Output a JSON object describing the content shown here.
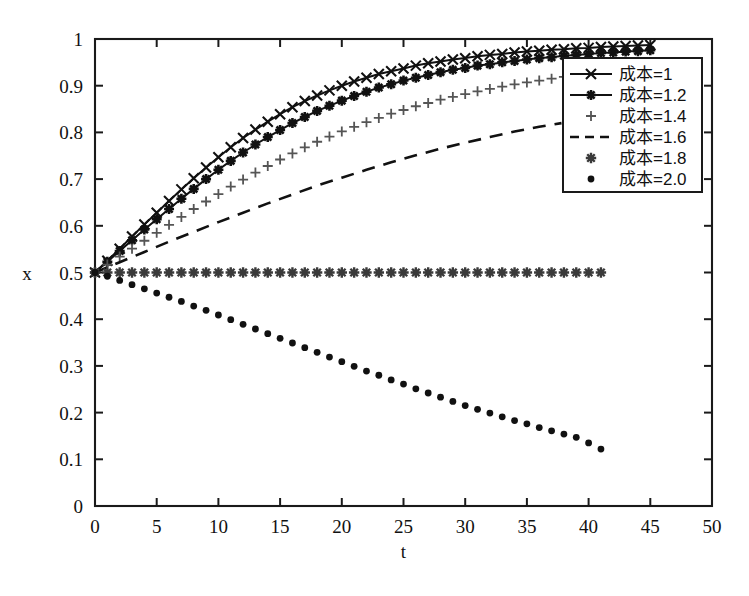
{
  "chart_data": {
    "type": "line",
    "title": "",
    "xlabel": "t",
    "ylabel": "x",
    "xlim": [
      0,
      50
    ],
    "ylim": [
      0,
      1
    ],
    "xticks": [
      0,
      5,
      10,
      15,
      20,
      25,
      30,
      35,
      40,
      45,
      50
    ],
    "xtick_labels": [
      "0",
      "5",
      "10",
      "15",
      "20",
      "25",
      "30",
      "35",
      "40",
      "45",
      "50"
    ],
    "yticks": [
      0,
      0.1,
      0.2,
      0.3,
      0.4,
      0.5,
      0.6,
      0.7,
      0.8,
      0.9,
      1
    ],
    "ytick_labels": [
      "0",
      "0.1",
      "0.2",
      "0.3",
      "0.4",
      "0.5",
      "0.6",
      "0.7",
      "0.8",
      "0.9",
      "1"
    ],
    "grid": false,
    "legend_position": "upper right",
    "series": [
      {
        "name": "成本=1",
        "marker": "x",
        "line": "solid",
        "color": "#111111",
        "x": [
          0,
          1,
          2,
          3,
          4,
          5,
          6,
          7,
          8,
          9,
          10,
          11,
          12,
          13,
          14,
          15,
          16,
          17,
          18,
          19,
          20,
          21,
          22,
          23,
          24,
          25,
          26,
          27,
          28,
          29,
          30,
          31,
          32,
          33,
          34,
          35,
          36,
          37,
          38,
          39,
          40,
          41,
          42,
          43,
          44,
          45
        ],
        "values": [
          0.5,
          0.525,
          0.551,
          0.577,
          0.603,
          0.628,
          0.653,
          0.678,
          0.702,
          0.725,
          0.747,
          0.768,
          0.788,
          0.806,
          0.823,
          0.839,
          0.854,
          0.867,
          0.879,
          0.89,
          0.9,
          0.909,
          0.917,
          0.925,
          0.931,
          0.937,
          0.943,
          0.948,
          0.952,
          0.956,
          0.959,
          0.963,
          0.966,
          0.968,
          0.971,
          0.973,
          0.975,
          0.977,
          0.978,
          0.98,
          0.981,
          0.983,
          0.984,
          0.985,
          0.986,
          0.987
        ]
      },
      {
        "name": "成本=1.2",
        "marker": "star",
        "line": "solid",
        "color": "#111111",
        "x": [
          0,
          1,
          2,
          3,
          4,
          5,
          6,
          7,
          8,
          9,
          10,
          11,
          12,
          13,
          14,
          15,
          16,
          17,
          18,
          19,
          20,
          21,
          22,
          23,
          24,
          25,
          26,
          27,
          28,
          29,
          30,
          31,
          32,
          33,
          34,
          35,
          36,
          37,
          38,
          39,
          40,
          41,
          42,
          43,
          44,
          45
        ],
        "values": [
          0.5,
          0.523,
          0.546,
          0.569,
          0.592,
          0.614,
          0.636,
          0.658,
          0.679,
          0.7,
          0.72,
          0.739,
          0.757,
          0.774,
          0.79,
          0.805,
          0.82,
          0.833,
          0.846,
          0.857,
          0.868,
          0.878,
          0.887,
          0.896,
          0.903,
          0.911,
          0.917,
          0.923,
          0.929,
          0.934,
          0.938,
          0.943,
          0.946,
          0.95,
          0.953,
          0.956,
          0.959,
          0.961,
          0.964,
          0.966,
          0.968,
          0.97,
          0.971,
          0.973,
          0.974,
          0.976
        ]
      },
      {
        "name": "成本=1.4",
        "marker": "plus",
        "line": "none",
        "color": "#555555",
        "x": [
          0,
          1,
          2,
          3,
          4,
          5,
          6,
          7,
          8,
          9,
          10,
          11,
          12,
          13,
          14,
          15,
          16,
          17,
          18,
          19,
          20,
          21,
          22,
          23,
          24,
          25,
          26,
          27,
          28,
          29,
          30,
          31,
          32,
          33,
          34,
          35,
          36,
          37,
          38,
          39,
          40,
          41
        ],
        "values": [
          0.5,
          0.517,
          0.534,
          0.551,
          0.568,
          0.585,
          0.602,
          0.619,
          0.636,
          0.652,
          0.668,
          0.684,
          0.699,
          0.714,
          0.728,
          0.742,
          0.755,
          0.768,
          0.78,
          0.791,
          0.802,
          0.812,
          0.822,
          0.831,
          0.84,
          0.848,
          0.856,
          0.863,
          0.87,
          0.876,
          0.882,
          0.888,
          0.893,
          0.898,
          0.903,
          0.907,
          0.911,
          0.915,
          0.919,
          0.922,
          0.925,
          0.928
        ]
      },
      {
        "name": "成本=1.6",
        "marker": "none",
        "line": "dashed",
        "color": "#111111",
        "x": [
          0,
          2,
          4,
          6,
          8,
          10,
          12,
          14,
          16,
          18,
          20,
          22,
          24,
          26,
          28,
          30,
          32,
          34,
          36,
          37.8
        ],
        "values": [
          0.5,
          0.522,
          0.544,
          0.566,
          0.587,
          0.608,
          0.628,
          0.648,
          0.667,
          0.686,
          0.703,
          0.72,
          0.736,
          0.751,
          0.765,
          0.778,
          0.79,
          0.802,
          0.812,
          0.82
        ]
      },
      {
        "name": "成本=1.8",
        "marker": "asterisk",
        "line": "none",
        "color": "#3a3a3a",
        "x": [
          0,
          1,
          2,
          3,
          4,
          5,
          6,
          7,
          8,
          9,
          10,
          11,
          12,
          13,
          14,
          15,
          16,
          17,
          18,
          19,
          20,
          21,
          22,
          23,
          24,
          25,
          26,
          27,
          28,
          29,
          30,
          31,
          32,
          33,
          34,
          35,
          36,
          37,
          38,
          39,
          40,
          41
        ],
        "values": [
          0.5,
          0.5,
          0.5,
          0.5,
          0.5,
          0.5,
          0.5,
          0.5,
          0.5,
          0.5,
          0.5,
          0.5,
          0.5,
          0.5,
          0.5,
          0.5,
          0.5,
          0.5,
          0.5,
          0.5,
          0.5,
          0.5,
          0.5,
          0.5,
          0.5,
          0.5,
          0.5,
          0.5,
          0.5,
          0.5,
          0.5,
          0.5,
          0.5,
          0.5,
          0.5,
          0.5,
          0.5,
          0.5,
          0.5,
          0.5,
          0.5,
          0.5
        ]
      },
      {
        "name": "成本=2.0",
        "marker": "dot",
        "line": "none",
        "color": "#111111",
        "x": [
          0,
          1,
          2,
          3,
          4,
          5,
          6,
          7,
          8,
          9,
          10,
          11,
          12,
          13,
          14,
          15,
          16,
          17,
          18,
          19,
          20,
          21,
          22,
          23,
          24,
          25,
          26,
          27,
          28,
          29,
          30,
          31,
          32,
          33,
          34,
          35,
          36,
          37,
          38,
          39,
          40,
          41
        ],
        "values": [
          0.5,
          0.492,
          0.483,
          0.474,
          0.465,
          0.456,
          0.447,
          0.438,
          0.428,
          0.419,
          0.409,
          0.399,
          0.389,
          0.379,
          0.369,
          0.359,
          0.349,
          0.339,
          0.329,
          0.319,
          0.309,
          0.299,
          0.289,
          0.28,
          0.27,
          0.261,
          0.251,
          0.242,
          0.233,
          0.224,
          0.215,
          0.207,
          0.199,
          0.191,
          0.183,
          0.176,
          0.168,
          0.161,
          0.154,
          0.147,
          0.135,
          0.122
        ]
      }
    ]
  },
  "legend": {
    "entries": [
      {
        "label": "成本=1",
        "marker": "x",
        "line": "solid"
      },
      {
        "label": "成本=1.2",
        "marker": "star",
        "line": "solid"
      },
      {
        "label": "成本=1.4",
        "marker": "plus",
        "line": "none"
      },
      {
        "label": "成本=1.6",
        "marker": "none",
        "line": "dashed"
      },
      {
        "label": "成本=1.8",
        "marker": "asterisk",
        "line": "none"
      },
      {
        "label": "成本=2.0",
        "marker": "dot",
        "line": "none"
      }
    ]
  },
  "axes": {
    "x_title": "t",
    "y_title": "x"
  },
  "colors": {
    "axis": "#1a1a1a",
    "curve": "#111111",
    "faint": "#555555",
    "background": "#ffffff"
  }
}
